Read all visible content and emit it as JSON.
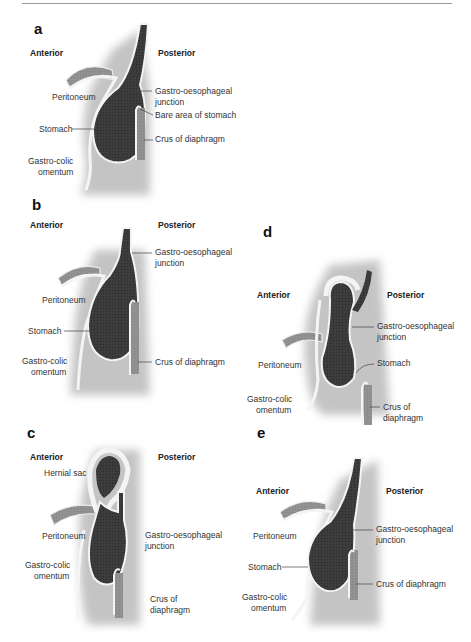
{
  "figure": {
    "panels": [
      {
        "id": "a",
        "label": "a",
        "anterior": "Anterior",
        "posterior": "Posterior",
        "labels": {
          "peritoneum": "Peritoneum",
          "stomach": "Stomach",
          "gastro_colic_1": "Gastro-colic",
          "gastro_colic_2": "omentum",
          "goj_1": "Gastro-oesophageal",
          "goj_2": "junction",
          "bare_area": "Bare area of stomach",
          "crus": "Crus of diaphragm"
        }
      },
      {
        "id": "b",
        "label": "b",
        "anterior": "Anterior",
        "posterior": "Posterior",
        "labels": {
          "peritoneum": "Peritoneum",
          "stomach": "Stomach",
          "gastro_colic_1": "Gastro-colic",
          "gastro_colic_2": "omentum",
          "goj_1": "Gastro-oesophageal",
          "goj_2": "junction",
          "crus": "Crus of diaphragm"
        }
      },
      {
        "id": "c",
        "label": "c",
        "anterior": "Anterior",
        "posterior": "Posterior",
        "labels": {
          "hernial_sac": "Hernial sac",
          "peritoneum": "Peritoneum",
          "gastro_colic_1": "Gastro-colic",
          "gastro_colic_2": "omentum",
          "goj_1": "Gastro-oesophageal",
          "goj_2": "junction",
          "crus_1": "Crus of",
          "crus_2": "diaphragm"
        }
      },
      {
        "id": "d",
        "label": "d",
        "anterior": "Anterior",
        "posterior": "Posterior",
        "labels": {
          "peritoneum": "Peritoneum",
          "gastro_colic_1": "Gastro-colic",
          "gastro_colic_2": "omentum",
          "goj_1": "Gastro-oesophageal",
          "goj_2": "junction",
          "stomach": "Stomach",
          "crus_1": "Crus of",
          "crus_2": "diaphragm"
        }
      },
      {
        "id": "e",
        "label": "e",
        "anterior": "Anterior",
        "posterior": "Posterior",
        "labels": {
          "peritoneum": "Peritoneum",
          "stomach": "Stomach",
          "gastro_colic_1": "Gastro-colic",
          "gastro_colic_2": "omentum",
          "goj_1": "Gastro-oesophageal",
          "goj_2": "junction",
          "crus": "Crus of diaphragm"
        }
      }
    ],
    "colors": {
      "stomach": "#3e3e3e",
      "lining": "#f2f2f2",
      "shadow": "#bdbdbd",
      "muscle": "#8a8a8a",
      "leader": "#444444"
    }
  }
}
